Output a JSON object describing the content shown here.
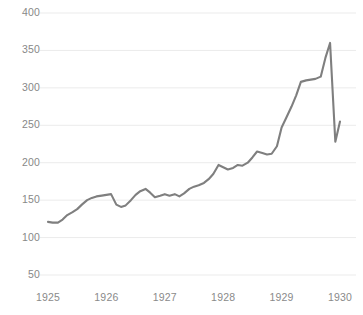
{
  "chart_data": {
    "type": "line",
    "title": "",
    "subtitle": "",
    "xlabel": "",
    "ylabel": "",
    "xlim": [
      1925.0,
      1930.05
    ],
    "ylim": [
      35,
      410
    ],
    "yticks": [
      50,
      100,
      150,
      200,
      250,
      300,
      350,
      400
    ],
    "ytick_labels": [
      "50",
      "100",
      "150",
      "200",
      "250",
      "300",
      "350",
      "400"
    ],
    "xticks": [
      1925,
      1926,
      1927,
      1928,
      1929,
      1930
    ],
    "xtick_labels": [
      "1925",
      "1926",
      "1927",
      "1928",
      "1929",
      "1930"
    ],
    "grid": "horizontal",
    "legend": "none",
    "annotations": [],
    "series": [
      {
        "name": "index",
        "color": "#7f7f7f",
        "line_width": 2.1,
        "x": [
          1925.0,
          1925.08,
          1925.17,
          1925.25,
          1925.33,
          1925.42,
          1925.5,
          1925.58,
          1925.67,
          1925.75,
          1925.83,
          1925.92,
          1926.0,
          1926.08,
          1926.17,
          1926.25,
          1926.33,
          1926.42,
          1926.5,
          1926.58,
          1926.67,
          1926.75,
          1926.83,
          1926.92,
          1927.0,
          1927.08,
          1927.17,
          1927.25,
          1927.33,
          1927.42,
          1927.5,
          1927.58,
          1927.67,
          1927.75,
          1927.83,
          1927.92,
          1928.0,
          1928.08,
          1928.17,
          1928.25,
          1928.33,
          1928.42,
          1928.5,
          1928.58,
          1928.67,
          1928.75,
          1928.83,
          1928.92,
          1929.0,
          1929.08,
          1929.17,
          1929.25,
          1929.33,
          1929.42,
          1929.5,
          1929.58,
          1929.67,
          1929.75,
          1929.83,
          1929.92,
          1930.0
        ],
        "values": [
          121,
          120,
          120,
          124,
          130,
          134,
          138,
          144,
          150,
          153,
          155,
          156,
          157,
          158,
          144,
          141,
          143,
          150,
          157,
          162,
          165,
          160,
          154,
          156,
          158,
          156,
          158,
          155,
          159,
          165,
          168,
          170,
          173,
          178,
          185,
          197,
          194,
          191,
          193,
          197,
          196,
          200,
          207,
          215,
          213,
          211,
          212,
          222,
          247,
          260,
          275,
          290,
          308,
          310,
          311,
          312,
          315,
          340,
          360,
          228,
          255
        ]
      }
    ]
  },
  "axis": {
    "y_label_color": "#888888",
    "x_label_color": "#8a8a8a",
    "grid_color": "#ebebeb",
    "background": "#ffffff"
  }
}
